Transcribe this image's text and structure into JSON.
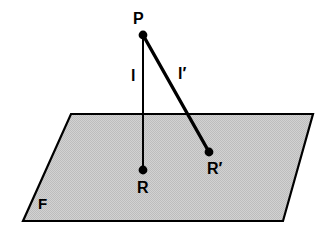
{
  "figure": {
    "type": "geometry-diagram",
    "background_color": "#ffffff",
    "stroke_color": "#000000",
    "plane": {
      "label": "F",
      "fill_color": "#cccccc",
      "stroke_color": "#000000",
      "stroke_width": 2.2,
      "corners": [
        {
          "name": "top-left",
          "x": 71,
          "y": 114
        },
        {
          "name": "top-right",
          "x": 313,
          "y": 114
        },
        {
          "name": "bottom-right",
          "x": 283,
          "y": 221
        },
        {
          "name": "bottom-left",
          "x": 23,
          "y": 221
        }
      ]
    },
    "points": [
      {
        "id": "P",
        "label": "P",
        "x": 143,
        "y": 35,
        "radius": 4.2,
        "label_x": 133,
        "label_y": 11
      },
      {
        "id": "R",
        "label": "R",
        "x": 143,
        "y": 170,
        "radius": 4.2,
        "label_x": 137,
        "label_y": 180
      },
      {
        "id": "Rp",
        "label": "R'",
        "x": 209,
        "y": 152,
        "radius": 4.2,
        "label_x": 207,
        "label_y": 161
      }
    ],
    "segments": [
      {
        "id": "l",
        "label": "l",
        "from": "P",
        "to": "R",
        "x1": 143,
        "y1": 35,
        "x2": 143,
        "y2": 170,
        "stroke_width": 2.0,
        "label_x": 131,
        "label_y": 68,
        "role": "perpendicular"
      },
      {
        "id": "l-prime",
        "label": "l'",
        "from": "P",
        "to": "Rp",
        "x1": 143,
        "y1": 35,
        "x2": 209,
        "y2": 152,
        "stroke_width": 3.4,
        "label_x": 178,
        "label_y": 66,
        "role": "oblique"
      }
    ],
    "labels": {
      "p": "P",
      "l": "l",
      "l_prime": "l′",
      "r": "R",
      "r_prime": "R′",
      "f": "F"
    }
  }
}
